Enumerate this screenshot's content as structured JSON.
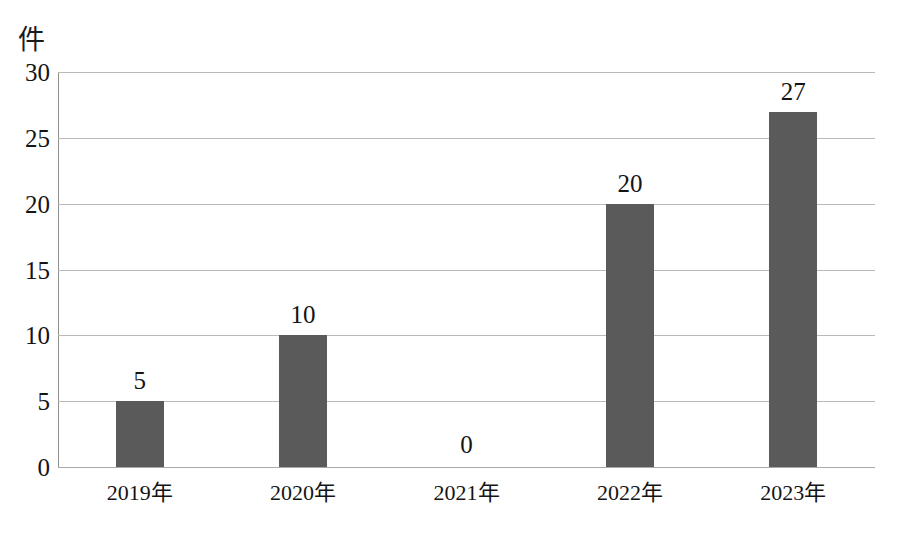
{
  "chart_data": {
    "type": "bar",
    "title": "",
    "subtitle": "",
    "xlabel": "",
    "ylabel": "件",
    "unit_label": "件",
    "categories": [
      "2019年",
      "2020年",
      "2021年",
      "2022年",
      "2023年"
    ],
    "values": [
      5,
      10,
      0,
      20,
      27
    ],
    "data_labels": [
      "5",
      "10",
      "0",
      "20",
      "27"
    ],
    "ylim": [
      0,
      30
    ],
    "y_ticks": [
      0,
      5,
      10,
      15,
      20,
      25,
      30
    ],
    "y_tick_labels": [
      "0",
      "5",
      "10",
      "15",
      "20",
      "25",
      "30"
    ],
    "grid": "horizontal",
    "legend": "none",
    "series": [
      {
        "name": "件数",
        "values": [
          5,
          10,
          0,
          20,
          27
        ]
      }
    ],
    "colors": {
      "bar": "#5a5a5a",
      "gridline": "#b9b9b9",
      "axis": "#8f8f8f",
      "text": "#141414",
      "background": "#ffffff"
    }
  }
}
